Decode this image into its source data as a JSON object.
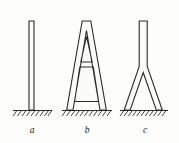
{
  "figure": {
    "background_color": "#fdfdfc",
    "line_color": "#2b2b2b",
    "width": 179,
    "height": 143,
    "ground_level_y": 110,
    "panels": [
      {
        "id": "a",
        "label": "a",
        "label_x": 32,
        "label_y": 133,
        "description": "straight vertical column fixed at base",
        "type": "straight-column",
        "top_y": 21,
        "base_y": 110,
        "shaft_left_x": 29,
        "shaft_right_x": 34,
        "ground_line": {
          "x1": 13,
          "x2": 52,
          "y": 110
        },
        "hatch_count": 9
      },
      {
        "id": "b",
        "label": "b",
        "label_x": 87,
        "label_y": 133,
        "description": "A-frame portal with horizontal cross beam",
        "type": "a-frame",
        "top_y": 21,
        "base_y": 110,
        "apex_left_x": 82,
        "apex_right_x": 91,
        "foot_left_x": 67,
        "foot_right_x": 106,
        "crossbar_top_y": 62,
        "crossbar_bottom_y": 67,
        "ground_line": {
          "x1": 62,
          "x2": 112,
          "y": 110
        },
        "hatch_count": 11
      },
      {
        "id": "c",
        "label": "c",
        "label_x": 145,
        "label_y": 133,
        "description": "Y-shaped column splitting into two splayed legs",
        "type": "y-column",
        "top_y": 21,
        "base_y": 110,
        "shaft_left_x": 139,
        "shaft_right_x": 147,
        "split_y": 69,
        "foot_left_x": 125,
        "foot_right_x": 162,
        "ground_line": {
          "x1": 120,
          "x2": 168,
          "y": 110
        },
        "hatch_count": 11
      }
    ]
  }
}
